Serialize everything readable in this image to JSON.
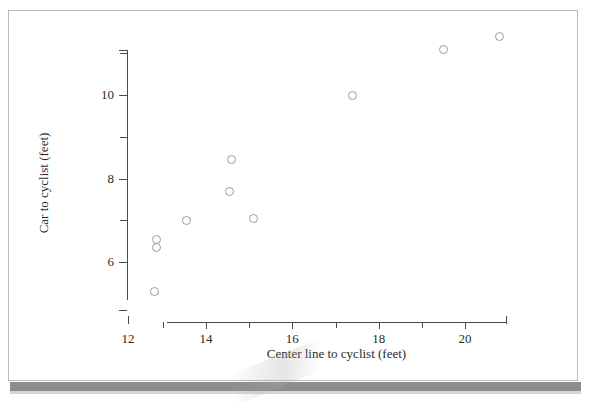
{
  "figure": {
    "background_color": "#ffffff",
    "frame_color": "#b9b9b9",
    "shadow_bar_color": "#8d8d8d"
  },
  "chart_data": {
    "type": "scatter",
    "title": "",
    "xlabel": "Center line to cyclist (feet)",
    "ylabel": "Car to cyclist (feet)",
    "xlim": [
      12.0,
      21.0
    ],
    "ylim": [
      5.0,
      11.7
    ],
    "grid": false,
    "legend": null,
    "marker": {
      "shape": "open-circle",
      "edge_color": "#9a9aa2",
      "fill_color": "none",
      "size_px": 9
    },
    "x_ticks_major": [
      14,
      16,
      18,
      20
    ],
    "x_ticks_major_labels": [
      "14",
      "16",
      "18",
      "20"
    ],
    "x_ticks_minor": [
      13,
      15,
      17,
      19
    ],
    "x_detached_tick_label": "12",
    "y_ticks_major": [
      6,
      8,
      10
    ],
    "y_ticks_major_labels": [
      "6",
      "8",
      "10"
    ],
    "y_ticks_minor": [
      7,
      9,
      11
    ],
    "points": [
      {
        "x": 12.8,
        "y": 5.3
      },
      {
        "x": 12.85,
        "y": 6.55
      },
      {
        "x": 12.85,
        "y": 6.35
      },
      {
        "x": 13.55,
        "y": 7.0
      },
      {
        "x": 14.6,
        "y": 8.45
      },
      {
        "x": 14.55,
        "y": 7.7
      },
      {
        "x": 15.1,
        "y": 7.05
      },
      {
        "x": 17.4,
        "y": 10.0
      },
      {
        "x": 19.5,
        "y": 11.1
      },
      {
        "x": 20.8,
        "y": 11.4
      }
    ]
  }
}
